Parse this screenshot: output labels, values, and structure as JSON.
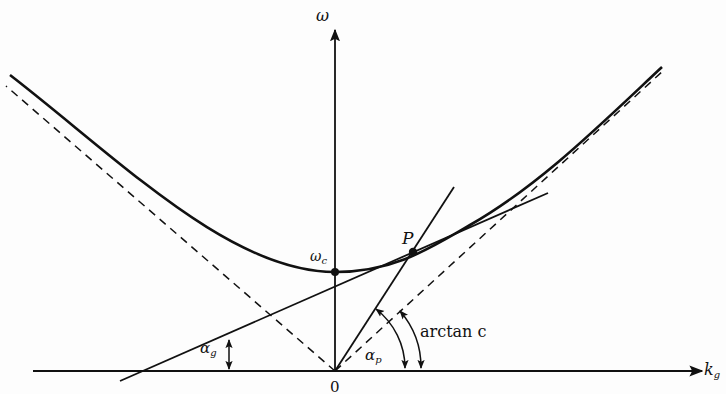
{
  "diagram": {
    "axes": {
      "x_label": "k",
      "x_label_sub": "g",
      "y_label": "ω",
      "origin_label": "0"
    },
    "points": {
      "cutoff_label": "ω",
      "cutoff_label_sub": "c",
      "p_label": "P"
    },
    "angles": {
      "group_label": "α",
      "group_label_sub": "g",
      "phase_label": "α",
      "phase_label_sub": "p",
      "asymptote_label": "arctan c"
    },
    "colors": {
      "ink": "#111111",
      "background": "#fdfdfd"
    }
  }
}
